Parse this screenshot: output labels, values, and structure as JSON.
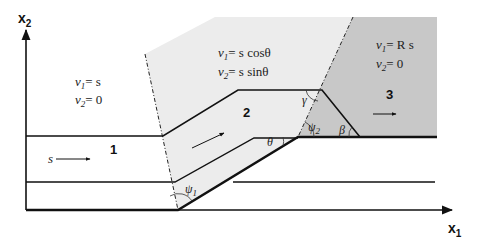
{
  "axes": {
    "x_label": "x",
    "x_sub": "1",
    "y_label": "x",
    "y_sub": "2"
  },
  "regions": [
    {
      "id": "1",
      "label": "1",
      "v1": {
        "lhs": "v",
        "sub": "1",
        "rhs": "= s"
      },
      "v2": {
        "lhs": "v",
        "sub": "2",
        "rhs": "= 0"
      },
      "fill": "#ffffff",
      "arrow_label": "s"
    },
    {
      "id": "2",
      "label": "2",
      "v1": {
        "lhs": "v",
        "sub": "1",
        "rhs": "= s cosθ"
      },
      "v2": {
        "lhs": "v",
        "sub": "2",
        "rhs": "= s sinθ"
      },
      "fill": "#ececec"
    },
    {
      "id": "3",
      "label": "3",
      "v1": {
        "lhs": "v",
        "sub": "1",
        "rhs": "= R s"
      },
      "v2": {
        "lhs": "v",
        "sub": "2",
        "rhs": "= 0"
      },
      "fill": "#c8c8c8"
    }
  ],
  "angles": {
    "psi1": {
      "sym": "ψ",
      "sub": "1"
    },
    "psi2": {
      "sym": "ψ",
      "sub": "2"
    },
    "theta": {
      "sym": "θ"
    },
    "gamma": {
      "sym": "γ"
    },
    "beta": {
      "sym": "β"
    }
  },
  "colors": {
    "line": "#111111",
    "region2": "#ececec",
    "region3": "#c8c8c8"
  }
}
